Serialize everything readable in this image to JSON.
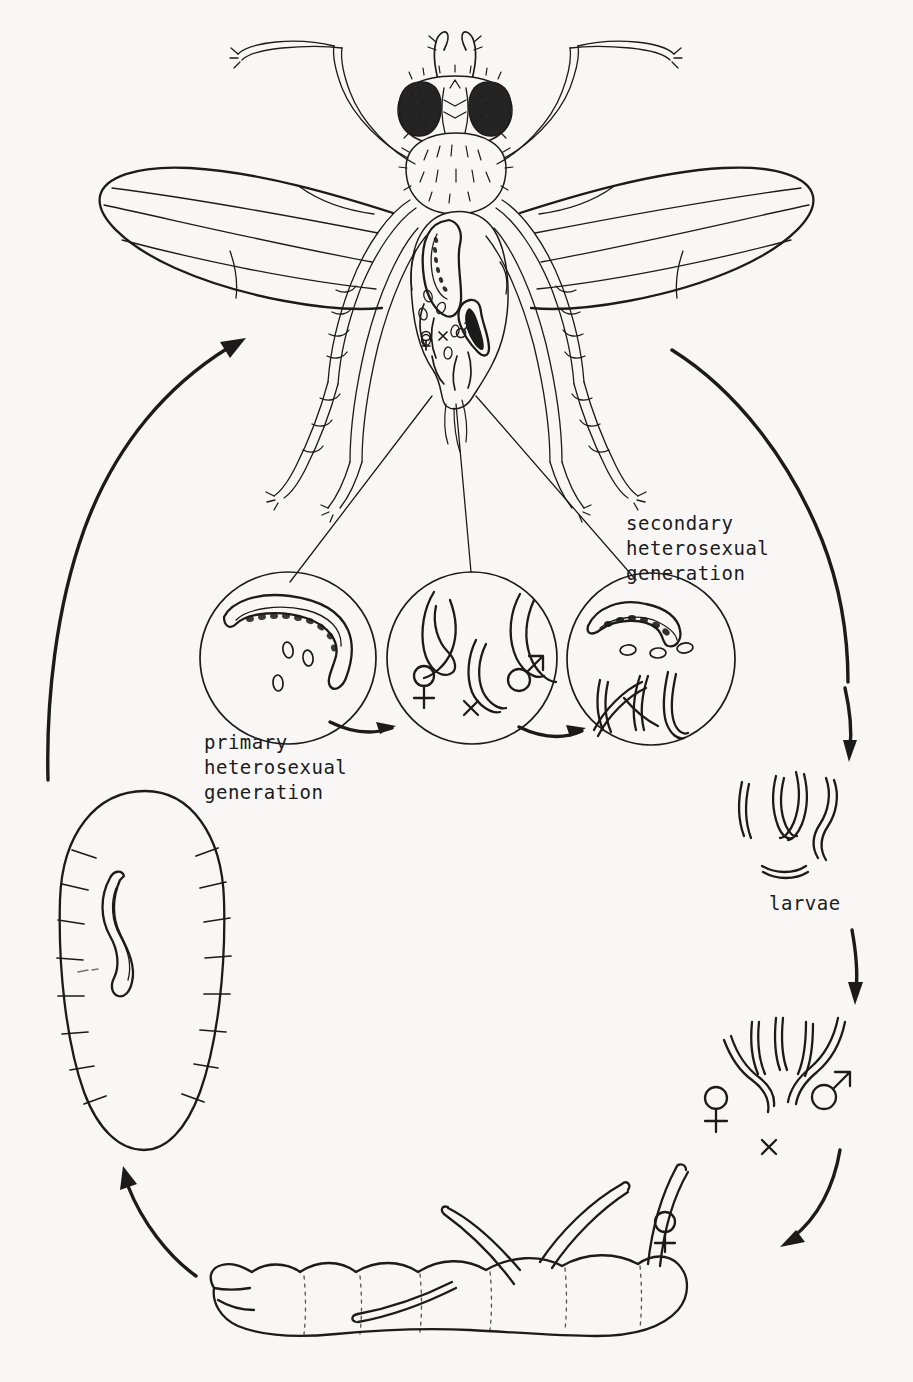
{
  "figure": {
    "domain": "Diagram",
    "background_color": "#f8f7f5",
    "ink_color": "#1b1b1b"
  },
  "labels": {
    "primary_generation": "primary\nheterosexual\ngeneration",
    "secondary_generation": "secondary\nheterosexual\ngeneration",
    "larvae": "larvae"
  },
  "symbols": {
    "female": "♀",
    "male": "♂",
    "cross": "×"
  },
  "stages": [
    {
      "id": "adult-fly",
      "name": "adult-fly-host",
      "description": "Adult fly with wings spread, nematodes visible inside abdomen",
      "position": "top-center"
    },
    {
      "id": "circle-primary",
      "name": "primary-heterosexual-generation-circle",
      "label": "primary\nheterosexual\ngeneration",
      "contents": "gravid female nematode with eggs",
      "position": "center-left"
    },
    {
      "id": "circle-mating",
      "name": "mating-generation-circle",
      "contents": "female and male nematodes mating",
      "symbols": [
        "♀",
        "×",
        "♂"
      ],
      "position": "center"
    },
    {
      "id": "circle-secondary",
      "name": "secondary-heterosexual-generation-circle",
      "label": "secondary\nheterosexual\ngeneration",
      "contents": "gravid female with eggs and juvenile larvae",
      "position": "center-right"
    },
    {
      "id": "larvae-free",
      "name": "free-living-larvae",
      "label": "larvae",
      "position": "right"
    },
    {
      "id": "larvae-mating",
      "name": "larvae-maturing-to-adults",
      "symbols": [
        "♀",
        "×",
        "♂"
      ],
      "position": "lower-right"
    },
    {
      "id": "maggot",
      "name": "fly-maggot-host-infection",
      "description": "Fly larva (maggot) being penetrated by infective female nematodes",
      "symbols": [
        "♀"
      ],
      "position": "bottom"
    },
    {
      "id": "egg",
      "name": "fly-pupa-with-nematode",
      "description": "Segmented fly pupa containing a single nematode",
      "position": "left"
    }
  ],
  "arrows": [
    {
      "name": "arrow-secondary-to-larvae",
      "direction": "down",
      "position": "right"
    },
    {
      "name": "arrow-larvae-to-adults",
      "direction": "down",
      "position": "lower-right"
    },
    {
      "name": "arrow-adults-to-maggot",
      "direction": "down-left",
      "position": "bottom-right"
    },
    {
      "name": "arrow-maggot-to-pupa",
      "direction": "up-left",
      "position": "bottom-left"
    },
    {
      "name": "arrow-pupa-to-fly",
      "direction": "up-right",
      "position": "left"
    },
    {
      "name": "arrow-primary-to-mating",
      "direction": "right",
      "position": "center"
    },
    {
      "name": "arrow-mating-to-secondary",
      "direction": "right",
      "position": "center"
    }
  ]
}
